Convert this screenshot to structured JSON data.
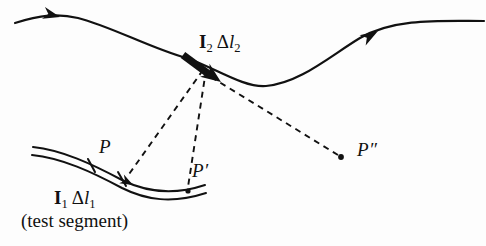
{
  "figure": {
    "caption_note": "(test segment)",
    "background_color": "#fdfdfd",
    "ink_color": "#111111"
  },
  "labels": {
    "source_segment": {
      "current_symbol": "I",
      "current_subscript": "2",
      "delta_symbol": "Δ",
      "length_symbol": "l",
      "length_subscript": "2",
      "plain": "I2 Δl2"
    },
    "test_segment": {
      "current_symbol": "I",
      "current_subscript": "1",
      "delta_symbol": "Δ",
      "length_symbol": "l",
      "length_subscript": "1",
      "plain": "I1 Δl1"
    },
    "test_segment_caption": "(test segment)",
    "point_p": "P",
    "point_p_prime": "P′",
    "point_p_double_prime": "P″"
  },
  "geometry": {
    "source_wire": {
      "name": "current-carrying wire",
      "path": "M 15,23 C 40,15 58,13 78,18 C 110,26 150,48 186,58 C 212,66 243,88 266,86 C 300,83 330,56 360,38 C 395,18 440,21 484,21",
      "stroke_width": 2.2,
      "arrowheads": [
        {
          "name": "wire-arrowhead-left",
          "x": 58,
          "y": 16,
          "angle": 16
        },
        {
          "name": "wire-arrowhead-right",
          "x": 374,
          "y": 33,
          "angle": -32
        }
      ]
    },
    "source_segment_marker": {
      "name": "bold-source-segment",
      "from_x": 183,
      "from_y": 55,
      "to_x": 214,
      "to_y": 77,
      "stroke_width": 7.5,
      "arrow_tip_x": 219,
      "arrow_tip_y": 80
    },
    "test_wire": {
      "name": "test wire ribbon",
      "upper_path": "M 33,147 C 62,150 92,164 122,180 C 146,192 172,196 205,185",
      "lower_path": "M 32,155 C 62,158 92,172 122,188 C 146,200 172,204 206,193",
      "stroke_width": 2.0,
      "ticks": [
        {
          "name": "tick-start",
          "x1": 89,
          "y1": 160,
          "x2": 95,
          "y2": 172
        },
        {
          "name": "tick-end",
          "x1": 119,
          "y1": 172,
          "x2": 126,
          "y2": 186
        }
      ],
      "arrowhead": {
        "name": "test-segment-arrowhead",
        "x": 128,
        "y": 181,
        "angle": 29
      }
    },
    "dashed_lines": [
      {
        "name": "dashed-line-to-P",
        "x1": 203,
        "y1": 70,
        "x2": 127,
        "y2": 177
      },
      {
        "name": "dashed-line-to-P-prime",
        "x1": 206,
        "y1": 70,
        "x2": 188,
        "y2": 188
      },
      {
        "name": "dashed-line-to-P-double-prime",
        "x1": 210,
        "y1": 76,
        "x2": 339,
        "y2": 156
      }
    ],
    "dots": [
      {
        "name": "dot-P-prime",
        "cx": 188,
        "cy": 191,
        "r": 2.6
      },
      {
        "name": "dot-P-double-prime",
        "cx": 341,
        "cy": 157,
        "r": 2.8
      }
    ]
  }
}
